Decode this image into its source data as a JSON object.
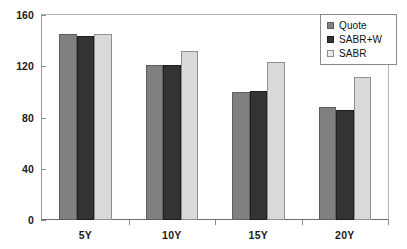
{
  "chart_data": {
    "type": "bar",
    "title": "",
    "xlabel": "",
    "ylabel": "",
    "categories": [
      "5Y",
      "10Y",
      "15Y",
      "20Y"
    ],
    "series": [
      {
        "name": "Quote",
        "color": "#808080",
        "values": [
          145,
          121,
          100,
          88
        ]
      },
      {
        "name": "SABR+W",
        "color": "#333333",
        "values": [
          144,
          121,
          101,
          86
        ]
      },
      {
        "name": "SABR",
        "color": "#d9d9d9",
        "values": [
          145,
          132,
          123,
          112
        ]
      }
    ],
    "ylim": [
      0,
      160
    ],
    "yticks": [
      0,
      40,
      80,
      120,
      160
    ],
    "ytick_labels": [
      "0",
      "40",
      "80",
      "120",
      "160"
    ],
    "xtick_labels": [
      "5Y",
      "10Y",
      "15Y",
      "20Y"
    ],
    "grid": false,
    "legend_position": "top-right"
  },
  "legend": {
    "items": [
      {
        "label": "Quote",
        "swatch": "legend-swatch-quote"
      },
      {
        "label": "SABR+W",
        "swatch": "legend-swatch-sabrw"
      },
      {
        "label": "SABR",
        "swatch": "legend-swatch-sabr"
      }
    ]
  },
  "colors": {
    "quote": "#808080",
    "sabr_w": "#333333",
    "sabr": "#d9d9d9",
    "axis": "#6e6e6e",
    "text": "#1a1a1a",
    "background": "#ffffff"
  }
}
